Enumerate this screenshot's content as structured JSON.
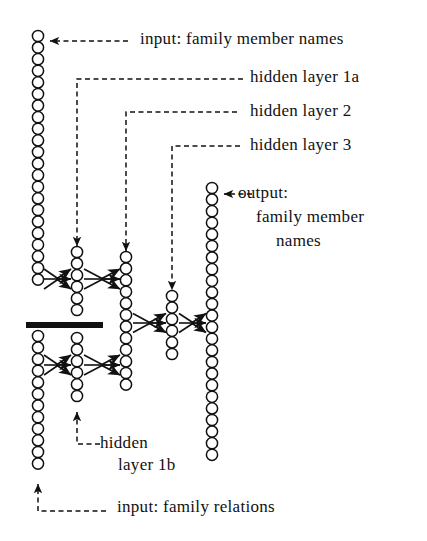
{
  "figure": {
    "kind": "neural-network-architecture-diagram",
    "background_color": "#ffffff",
    "ink_color": "#111111"
  },
  "labels": {
    "input_names": "input:   family  member  names",
    "hidden_1a": "hidden  layer  1a",
    "hidden_2": "hidden  layer  2",
    "hidden_3": "hidden  layer  3",
    "output_line1": "output:",
    "output_line2": "family  member",
    "output_line3": "names",
    "hidden_1b_line1": "hidden",
    "hidden_1b_line2": "layer  1b",
    "input_relations": "input:  family  relations"
  },
  "network": {
    "columns": [
      {
        "name": "input-family-member-names",
        "role": "input",
        "x": 38,
        "groups": [
          {
            "name": "input-names-upper-block",
            "top": 36,
            "count": 22
          },
          {
            "name": "input-relations-lower-block",
            "top": 336,
            "count": 12
          }
        ]
      },
      {
        "name": "hidden-layer-1",
        "role": "hidden",
        "x": 77,
        "groups": [
          {
            "name": "hidden-layer-1a",
            "top": 252,
            "count": 6
          },
          {
            "name": "hidden-layer-1b",
            "top": 338,
            "count": 6
          }
        ]
      },
      {
        "name": "hidden-layer-2",
        "role": "hidden",
        "x": 126,
        "groups": [
          {
            "name": "hidden-layer-2-block",
            "top": 257,
            "count": 12
          }
        ]
      },
      {
        "name": "hidden-layer-3",
        "role": "hidden",
        "x": 172,
        "groups": [
          {
            "name": "hidden-layer-3-block",
            "top": 296,
            "count": 6
          }
        ]
      },
      {
        "name": "output-family-member-names",
        "role": "output",
        "x": 212,
        "groups": [
          {
            "name": "output-block",
            "top": 188,
            "count": 24
          }
        ]
      }
    ],
    "node_radius": 5.6,
    "node_pitch": 11.6,
    "separator_bar": {
      "name": "input-group-separator",
      "x1": 26,
      "x2": 103,
      "y": 325,
      "thickness": 6
    },
    "connections": [
      {
        "name": "conn-input-upper-to-1a",
        "from_x": 44,
        "to_x": 71,
        "y": 279,
        "spread": 20
      },
      {
        "name": "conn-1a-to-layer2-upper",
        "from_x": 84,
        "to_x": 120,
        "y": 279,
        "spread": 20
      },
      {
        "name": "conn-input-lower-to-1b",
        "from_x": 44,
        "to_x": 71,
        "y": 365,
        "spread": 20
      },
      {
        "name": "conn-1b-to-layer2-lower",
        "from_x": 84,
        "to_x": 120,
        "y": 365,
        "spread": 20
      },
      {
        "name": "conn-layer2-to-layer3",
        "from_x": 133,
        "to_x": 166,
        "y": 323,
        "spread": 19
      },
      {
        "name": "conn-layer3-to-output",
        "from_x": 179,
        "to_x": 206,
        "y": 323,
        "spread": 19
      }
    ]
  },
  "leaders": {
    "input_names_arrow": {
      "name": "leader-input-names",
      "tip_x": 50,
      "tip_y": 41,
      "tail_x": 128,
      "tail_y": 41
    },
    "hidden_1a": {
      "name": "leader-hidden-1a",
      "tip_x": 77,
      "tip_y": 246,
      "corner_y": 79,
      "tail_x": 243
    },
    "hidden_2": {
      "name": "leader-hidden-2",
      "tip_x": 126,
      "tip_y": 251,
      "corner_y": 112,
      "tail_x": 237
    },
    "hidden_3": {
      "name": "leader-hidden-3",
      "tip_x": 172,
      "tip_y": 290,
      "corner_y": 146,
      "tail_x": 240
    },
    "output_arrow": {
      "name": "leader-output",
      "tip_x": 224,
      "tip_y": 194,
      "tail_x": 252,
      "tail_y": 194
    },
    "hidden_1b": {
      "name": "leader-hidden-1b",
      "tip_x": 77,
      "tip_y": 412,
      "corner_y": 444,
      "tail_x": 100
    },
    "input_relations": {
      "name": "leader-input-relations",
      "tip_x": 38,
      "tip_y": 484,
      "corner_y": 511,
      "tail_x": 106
    }
  },
  "text_positions": {
    "input_names": {
      "x": 140,
      "y": 30
    },
    "hidden_1a": {
      "x": 250,
      "y": 68
    },
    "hidden_2": {
      "x": 250,
      "y": 102
    },
    "hidden_3": {
      "x": 250,
      "y": 136
    },
    "output_line1": {
      "x": 238,
      "y": 184
    },
    "output_line2": {
      "x": 256,
      "y": 208
    },
    "output_line3": {
      "x": 276,
      "y": 232
    },
    "hidden_1b_line1": {
      "x": 100,
      "y": 434
    },
    "hidden_1b_line2": {
      "x": 118,
      "y": 456
    },
    "input_relations": {
      "x": 117,
      "y": 498
    }
  }
}
